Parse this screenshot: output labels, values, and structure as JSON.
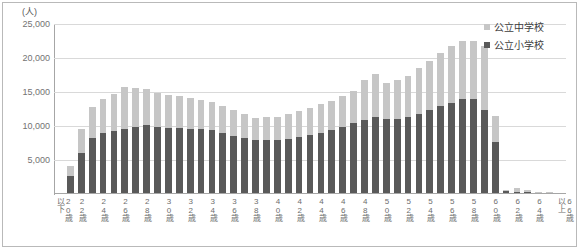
{
  "chart_data": {
    "type": "bar",
    "stacked": true,
    "title": "",
    "subtitle": "",
    "xlabel": "",
    "ylabel": "",
    "unit_label": "(人)",
    "ylim": [
      0,
      25000
    ],
    "ytick_values": [
      25000,
      20000,
      15000,
      10000,
      5000
    ],
    "ytick_labels": [
      "25,000",
      "20,000",
      "15,000",
      "10,000",
      "5,000"
    ],
    "grid": true,
    "legend_position": "top-right",
    "categories": [
      "20歳\n以下",
      "21歳",
      "22歳",
      "23歳",
      "24歳",
      "25歳",
      "26歳",
      "27歳",
      "28歳",
      "29歳",
      "30歳",
      "31歳",
      "32歳",
      "33歳",
      "34歳",
      "35歳",
      "36歳",
      "37歳",
      "38歳",
      "39歳",
      "40歳",
      "41歳",
      "42歳",
      "43歳",
      "44歳",
      "45歳",
      "46歳",
      "47歳",
      "48歳",
      "49歳",
      "50歳",
      "51歳",
      "52歳",
      "53歳",
      "54歳",
      "55歳",
      "56歳",
      "57歳",
      "58歳",
      "59歳",
      "60歳",
      "61歳",
      "62歳",
      "63歳",
      "64歳",
      "65歳",
      "66歳\n以上"
    ],
    "tick_label_every": 2,
    "series": [
      {
        "name": "公立小学校",
        "color": "#595959",
        "values": [
          120,
          2700,
          6100,
          8200,
          8900,
          9200,
          9600,
          9900,
          10100,
          9800,
          9700,
          9700,
          9600,
          9500,
          9400,
          9000,
          8600,
          8200,
          7900,
          8000,
          7900,
          8100,
          8400,
          8700,
          9000,
          9400,
          9900,
          10400,
          10900,
          11300,
          11100,
          11000,
          11300,
          11800,
          12300,
          12900,
          13400,
          13900,
          14000,
          12400,
          7700,
          400,
          330,
          260,
          200,
          150,
          110
        ]
      },
      {
        "name": "公立中学校",
        "color": "#c6c6c6",
        "values": [
          60,
          1350,
          3500,
          4600,
          5000,
          5500,
          6100,
          5700,
          5400,
          5100,
          4900,
          4700,
          4500,
          4300,
          4200,
          4000,
          3700,
          3500,
          3300,
          3300,
          3400,
          3600,
          3800,
          4000,
          4200,
          4300,
          4500,
          4700,
          5900,
          6300,
          5200,
          5700,
          6000,
          6700,
          7200,
          7800,
          8300,
          8600,
          8500,
          9300,
          3800,
          250,
          600,
          300,
          150,
          100,
          60
        ]
      }
    ]
  },
  "legend": {
    "items": [
      {
        "label": "公立中学校",
        "color": "#c6c6c6"
      },
      {
        "label": "公立小学校",
        "color": "#595959"
      }
    ]
  }
}
